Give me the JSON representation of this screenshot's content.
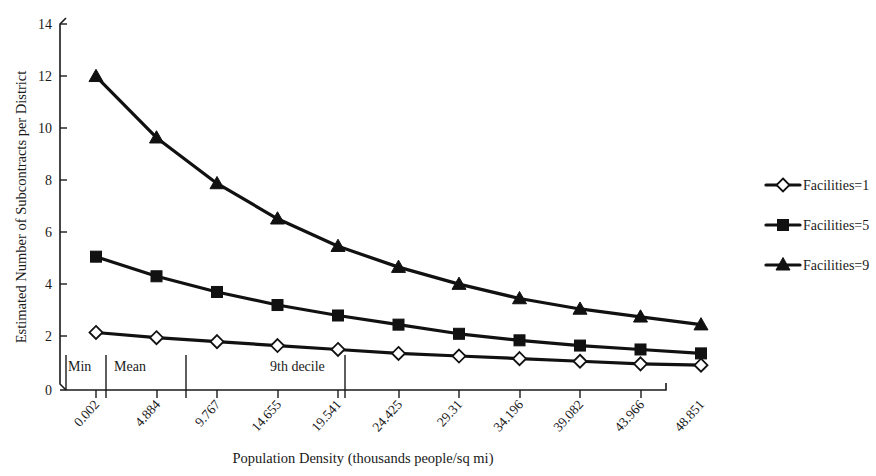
{
  "chart_data": {
    "type": "line",
    "title": "",
    "xlabel": "Population Density (thousands people/sq mi)",
    "ylabel": "Estimated Number of Subcontracts per District",
    "categories": [
      "0.002",
      "4.884",
      "9.767",
      "14.655",
      "19.541",
      "24.425",
      "29.31",
      "34.196",
      "39.082",
      "43.966",
      "48.851"
    ],
    "x_values": [
      0.002,
      4.884,
      9.767,
      14.655,
      19.541,
      24.425,
      29.31,
      34.196,
      39.082,
      43.966,
      48.851
    ],
    "series": [
      {
        "name": "Facilities=1",
        "marker": "diamond-hollow",
        "values": [
          2.2,
          2.0,
          1.85,
          1.7,
          1.55,
          1.4,
          1.3,
          1.2,
          1.1,
          1.0,
          0.95
        ]
      },
      {
        "name": "Facilities=5",
        "marker": "square-filled",
        "values": [
          5.1,
          4.35,
          3.75,
          3.25,
          2.85,
          2.5,
          2.15,
          1.9,
          1.7,
          1.55,
          1.4
        ]
      },
      {
        "name": "Facilities=9",
        "marker": "triangle-filled",
        "values": [
          12.0,
          9.65,
          7.9,
          6.55,
          5.5,
          4.7,
          4.05,
          3.5,
          3.1,
          2.8,
          2.5
        ]
      }
    ],
    "ylim": [
      0,
      14
    ],
    "y_ticks": [
      "0",
      "2",
      "4",
      "6",
      "8",
      "10",
      "12",
      "14"
    ],
    "y_tick_values": [
      0,
      2,
      4,
      6,
      8,
      10,
      12,
      14
    ],
    "grid": false,
    "legend_position": "right",
    "annotations": [
      {
        "label": "Min",
        "x_fraction": 0.012
      },
      {
        "label": "Mean",
        "x_fraction": 0.145
      },
      {
        "label": "9th decile",
        "x_fraction": 0.47
      }
    ],
    "line_color": "#111111",
    "axis_color": "#1a1a1a",
    "background": "#ffffff"
  },
  "legend": {
    "items": [
      {
        "label": "Facilities=1"
      },
      {
        "label": "Facilities=5"
      },
      {
        "label": "Facilities=9"
      }
    ]
  }
}
